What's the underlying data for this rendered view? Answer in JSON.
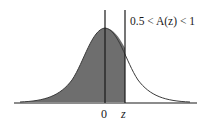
{
  "diagram": {
    "annotation": "0.5 < A(z) < 1",
    "axis_labels": [
      {
        "id": "zero",
        "text": "0"
      },
      {
        "id": "z",
        "text": "z"
      }
    ],
    "colors": {
      "shade": "#6e6e6e",
      "curve": "#3a3a3a",
      "line": "#1a1a1a",
      "background": "#ffffff"
    }
  }
}
